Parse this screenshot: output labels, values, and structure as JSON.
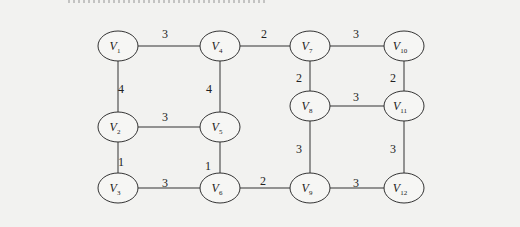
{
  "diagram": {
    "type": "weighted-undirected-graph",
    "nodes": [
      {
        "id": "V1",
        "letter": "V",
        "sub": "1",
        "x": 118,
        "y": 46
      },
      {
        "id": "V4",
        "letter": "V",
        "sub": "4",
        "x": 220,
        "y": 46
      },
      {
        "id": "V7",
        "letter": "V",
        "sub": "7",
        "x": 310,
        "y": 46
      },
      {
        "id": "V10",
        "letter": "V",
        "sub": "10",
        "x": 404,
        "y": 46
      },
      {
        "id": "V8",
        "letter": "V",
        "sub": "8",
        "x": 310,
        "y": 106
      },
      {
        "id": "V11",
        "letter": "V",
        "sub": "11",
        "x": 404,
        "y": 106
      },
      {
        "id": "V2",
        "letter": "V",
        "sub": "2",
        "x": 118,
        "y": 127
      },
      {
        "id": "V5",
        "letter": "V",
        "sub": "5",
        "x": 220,
        "y": 127
      },
      {
        "id": "V3",
        "letter": "V",
        "sub": "3",
        "x": 118,
        "y": 188
      },
      {
        "id": "V6",
        "letter": "V",
        "sub": "6",
        "x": 220,
        "y": 188
      },
      {
        "id": "V9",
        "letter": "V",
        "sub": "9",
        "x": 310,
        "y": 188
      },
      {
        "id": "V12",
        "letter": "V",
        "sub": "12",
        "x": 404,
        "y": 188
      }
    ],
    "edges": [
      {
        "from": "V1",
        "to": "V4",
        "weight": "3",
        "lx": 165,
        "ly": 34
      },
      {
        "from": "V4",
        "to": "V7",
        "weight": "2",
        "lx": 264,
        "ly": 34
      },
      {
        "from": "V7",
        "to": "V10",
        "weight": "3",
        "lx": 356,
        "ly": 34
      },
      {
        "from": "V1",
        "to": "V2",
        "weight": "4",
        "lx": 121,
        "ly": 89
      },
      {
        "from": "V4",
        "to": "V5",
        "weight": "4",
        "lx": 209,
        "ly": 89
      },
      {
        "from": "V7",
        "to": "V8",
        "weight": "2",
        "lx": 299,
        "ly": 78
      },
      {
        "from": "V10",
        "to": "V11",
        "weight": "2",
        "lx": 393,
        "ly": 78
      },
      {
        "from": "V8",
        "to": "V11",
        "weight": "3",
        "lx": 356,
        "ly": 97
      },
      {
        "from": "V2",
        "to": "V5",
        "weight": "3",
        "lx": 165,
        "ly": 117
      },
      {
        "from": "V2",
        "to": "V3",
        "weight": "1",
        "lx": 121,
        "ly": 162
      },
      {
        "from": "V5",
        "to": "V6",
        "weight": "1",
        "lx": 208,
        "ly": 166
      },
      {
        "from": "V8",
        "to": "V9",
        "weight": "3",
        "lx": 299,
        "ly": 149
      },
      {
        "from": "V11",
        "to": "V12",
        "weight": "3",
        "lx": 393,
        "ly": 149
      },
      {
        "from": "V3",
        "to": "V6",
        "weight": "3",
        "lx": 165,
        "ly": 183
      },
      {
        "from": "V6",
        "to": "V9",
        "weight": "2",
        "lx": 263,
        "ly": 181
      },
      {
        "from": "V9",
        "to": "V12",
        "weight": "3",
        "lx": 356,
        "ly": 183
      }
    ]
  },
  "style": {
    "background": "#f2f2f0",
    "stroke": "#333333",
    "node_fill": "#f6f6f4"
  }
}
